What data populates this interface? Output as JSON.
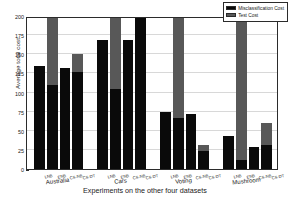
{
  "chart_data": {
    "type": "bar",
    "title": "",
    "xlabel": "Experiments on the other four datasets",
    "ylabel": "Average total cost",
    "ylim": [
      0,
      200
    ],
    "yticks": [
      0,
      25,
      50,
      75,
      100,
      125,
      150,
      175,
      200
    ],
    "ytick_labels": [
      "0",
      "25",
      "50",
      "75",
      "100",
      "125",
      "150",
      "175",
      "200"
    ],
    "grid": true,
    "stacked": true,
    "legend_position": "top-right",
    "legend": [
      "Misclassification Cost",
      "Test Cost"
    ],
    "colors": {
      "misclassification_cost": "#0a0a0a",
      "test_cost": "#585858",
      "axis": "#2b2b2b",
      "grid": "#d8d8d8",
      "background": "#ffffff"
    },
    "categories": [
      "LNB",
      "ENB",
      "CS-NB",
      "CS-DT"
    ],
    "groups": [
      {
        "name": "Australia",
        "bars": [
          {
            "label": "LNB",
            "misclassification_cost": 135,
            "test_cost": 0,
            "total": 135
          },
          {
            "label": "ENB",
            "misclassification_cost": 110,
            "test_cost": 90,
            "total": 200
          },
          {
            "label": "CS-NB",
            "misclassification_cost": 132,
            "test_cost": 0,
            "total": 132
          },
          {
            "label": "CS-DT",
            "misclassification_cost": 127,
            "test_cost": 24,
            "total": 151
          }
        ]
      },
      {
        "name": "Cars",
        "bars": [
          {
            "label": "LNB",
            "misclassification_cost": 169,
            "test_cost": 0,
            "total": 169
          },
          {
            "label": "ENB",
            "misclassification_cost": 105,
            "test_cost": 95,
            "total": 200
          },
          {
            "label": "CS-NB",
            "misclassification_cost": 169,
            "test_cost": 0,
            "total": 169
          },
          {
            "label": "CS-DT",
            "misclassification_cost": 200,
            "test_cost": 0,
            "total": 200
          }
        ]
      },
      {
        "name": "Voting",
        "bars": [
          {
            "label": "LNB",
            "misclassification_cost": 75,
            "test_cost": 0,
            "total": 75
          },
          {
            "label": "ENB",
            "misclassification_cost": 67,
            "test_cost": 133,
            "total": 200
          },
          {
            "label": "CS-NB",
            "misclassification_cost": 72,
            "test_cost": 0,
            "total": 72
          },
          {
            "label": "CS-DT",
            "misclassification_cost": 24,
            "test_cost": 7,
            "total": 31
          }
        ]
      },
      {
        "name": "Mushroom",
        "bars": [
          {
            "label": "LNB",
            "misclassification_cost": 43,
            "test_cost": 0,
            "total": 43
          },
          {
            "label": "ENB",
            "misclassification_cost": 12,
            "test_cost": 188,
            "total": 200
          },
          {
            "label": "CS-NB",
            "misclassification_cost": 29,
            "test_cost": 0,
            "total": 29
          },
          {
            "label": "CS-DT",
            "misclassification_cost": 31,
            "test_cost": 29,
            "total": 60
          }
        ]
      }
    ]
  }
}
